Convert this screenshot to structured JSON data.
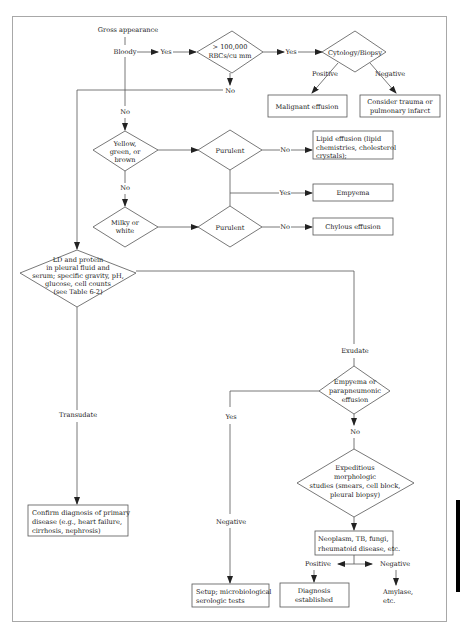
{
  "diagram": {
    "title": "Gross appearance",
    "nodes": {
      "bloody": "Bloody",
      "rbc_decision": [
        "> 100,000",
        "RBCs/cu mm"
      ],
      "cytology": "Cytology/Biopsy",
      "malignant": "Malignant effusion",
      "trauma": [
        "Consider trauma or",
        "pulmonary infarct"
      ],
      "yellow_decision": [
        "Yellow,",
        "green, or",
        "brown"
      ],
      "purulent_1": "Purulent",
      "lipid": [
        "Lipid effusion (lipid",
        "chemistries, cholesterol",
        "crystals);"
      ],
      "empyema": "Empyema",
      "milky_decision": [
        "Milky or",
        "white"
      ],
      "purulent_2": "Purulent",
      "chylous": "Chylous effusion",
      "ld_decision": [
        "LD and protein",
        "in pleural fluid and",
        "serum; specific gravity, pH,",
        "glucose, cell counts",
        "(see Table 6-2)"
      ],
      "empyema_decision": [
        "Empyema or",
        "parapneumonic",
        "effusion"
      ],
      "expeditious": [
        "Expeditious",
        "morphologic",
        "studies (smears, cell block,",
        "pleural biopsy)"
      ],
      "confirm": [
        "Confirm diagnosis of primary",
        "disease (e.g., heart failure,",
        "cirrhosis, nephrosis)"
      ],
      "neoplasm": [
        "Neoplasm, TB, fungi,",
        "rheumatoid disease, etc."
      ],
      "setup": [
        "Setup; microbiological",
        "serologic tests"
      ],
      "diagnosis": [
        "Diagnosis",
        "established"
      ],
      "amylase": [
        "Amylase,",
        "etc."
      ]
    },
    "edge_labels": {
      "bloody_yes": "Yes",
      "rbc_yes": "Yes",
      "rbc_no": "No",
      "bloody_no": "No",
      "cyto_positive": "Positive",
      "cyto_negative": "Negative",
      "purulent1_no": "No",
      "purulent_yes": "Yes",
      "yellow_no": "No",
      "purulent2_no": "No",
      "exudate": "Exudate",
      "transudate": "Transudate",
      "empyema_yes": "Yes",
      "empyema_no": "No",
      "negative": "Negative",
      "neoplasm_positive": "Positive",
      "neoplasm_negative": "Negative"
    }
  }
}
